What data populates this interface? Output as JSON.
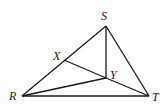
{
  "diagram": {
    "type": "geometry-triangle",
    "points": {
      "S": {
        "label": "S",
        "x": 106,
        "y": 26,
        "lx": 101,
        "ly": 20
      },
      "R": {
        "label": "R",
        "x": 22,
        "y": 96,
        "lx": 9,
        "ly": 100
      },
      "T": {
        "label": "T",
        "x": 149,
        "y": 96,
        "lx": 152,
        "ly": 101
      },
      "X": {
        "label": "X",
        "x": 64,
        "y": 60,
        "lx": 53,
        "ly": 60
      },
      "Y": {
        "label": "Y",
        "x": 106,
        "y": 78,
        "lx": 110,
        "ly": 79
      }
    },
    "segments": [
      [
        "S",
        "R"
      ],
      [
        "S",
        "T"
      ],
      [
        "R",
        "T"
      ],
      [
        "S",
        "Y"
      ],
      [
        "X",
        "Y"
      ],
      [
        "Y",
        "T"
      ],
      [
        "R",
        "Y"
      ]
    ],
    "stroke_color": "#1a1a1a"
  }
}
